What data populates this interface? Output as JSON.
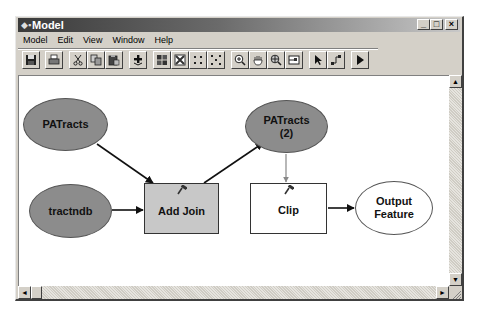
{
  "window": {
    "title": "Model",
    "title_icon": "model-builder-icon",
    "controls": {
      "minimize": "_",
      "maximize": "□",
      "close": "×"
    }
  },
  "menubar": {
    "items": [
      {
        "label": "Model"
      },
      {
        "label": "Edit"
      },
      {
        "label": "View"
      },
      {
        "label": "Window"
      },
      {
        "label": "Help"
      }
    ]
  },
  "toolbar": {
    "buttons": [
      {
        "name": "save",
        "icon": "save-icon"
      },
      {
        "name": "print",
        "icon": "printer-icon"
      },
      {
        "name": "cut",
        "icon": "scissors-icon"
      },
      {
        "name": "copy",
        "icon": "copy-icon"
      },
      {
        "name": "paste",
        "icon": "paste-icon"
      },
      {
        "name": "add-data",
        "icon": "plus-icon"
      },
      {
        "name": "full-extent",
        "icon": "grid-icon"
      },
      {
        "name": "zoom-to-selected",
        "icon": "fit-icon"
      },
      {
        "name": "fixed-zoom-in",
        "icon": "zoom-in-dots-icon"
      },
      {
        "name": "fixed-zoom-out",
        "icon": "zoom-out-dots-icon"
      },
      {
        "name": "zoom-in",
        "icon": "zoom-in-icon"
      },
      {
        "name": "pan",
        "icon": "hand-icon"
      },
      {
        "name": "zoom-full",
        "icon": "zoom-extent-icon"
      },
      {
        "name": "overview",
        "icon": "overview-window-icon"
      },
      {
        "name": "select",
        "icon": "arrow-pointer-icon"
      },
      {
        "name": "connect",
        "icon": "connect-icon"
      },
      {
        "name": "run",
        "icon": "play-icon"
      }
    ]
  },
  "diagram": {
    "colors": {
      "data_fill": "#8c8c8c",
      "tool_fill": "#c8c8c8",
      "output_fill": "#ffffff",
      "edge": "#111111",
      "edge_precondition": "#888888"
    },
    "nodes": [
      {
        "id": "patracts",
        "label": "PATracts",
        "shape": "ellipse",
        "kind": "input-data"
      },
      {
        "id": "tractndb",
        "label": "tractndb",
        "shape": "ellipse",
        "kind": "input-data"
      },
      {
        "id": "addjoin",
        "label": "Add Join",
        "shape": "rect",
        "kind": "tool"
      },
      {
        "id": "patracts2",
        "label": "PATracts\n(2)",
        "shape": "ellipse",
        "kind": "derived-data"
      },
      {
        "id": "clip",
        "label": "Clip",
        "shape": "rect",
        "kind": "tool"
      },
      {
        "id": "output",
        "label": "Output\nFeature",
        "shape": "ellipse",
        "kind": "output-data"
      }
    ],
    "edges": [
      {
        "from": "patracts",
        "to": "addjoin"
      },
      {
        "from": "tractndb",
        "to": "addjoin"
      },
      {
        "from": "addjoin",
        "to": "patracts2"
      },
      {
        "from": "patracts2",
        "to": "clip"
      },
      {
        "from": "clip",
        "to": "output"
      }
    ]
  },
  "scrollbars": {
    "vertical": {
      "up": "▲",
      "down": "▼"
    },
    "horizontal": {
      "left": "◄",
      "right": "►"
    }
  }
}
